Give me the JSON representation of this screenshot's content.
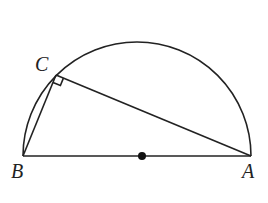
{
  "figure": {
    "type": "semicircle with inscribed right triangle",
    "points": {
      "A": {
        "label": "A",
        "x": 251,
        "y": 156
      },
      "B": {
        "label": "B",
        "x": 23,
        "y": 156
      },
      "C": {
        "label": "C",
        "x": 56,
        "y": 75
      },
      "O": {
        "label": "",
        "x": 142,
        "y": 156
      }
    },
    "radius": 114,
    "segments": [
      "AB",
      "BC",
      "CA"
    ],
    "right_angle_at": "C",
    "center_dot": true,
    "colors": {
      "stroke": "#222222",
      "background": "#ffffff"
    }
  }
}
